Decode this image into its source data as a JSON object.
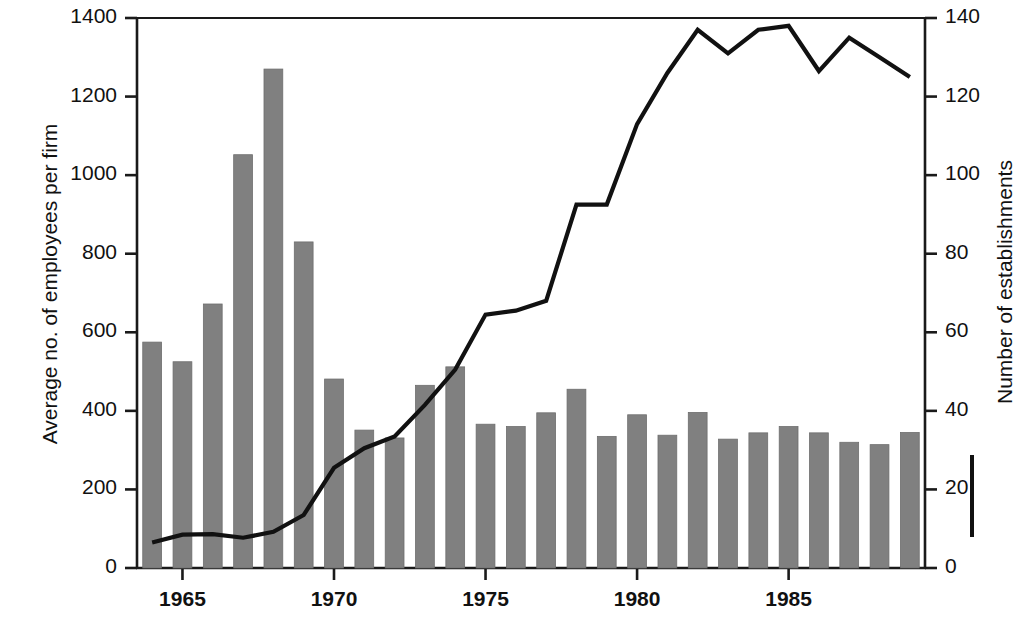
{
  "chart_data": {
    "type": "bar",
    "title": "",
    "xlabel": "",
    "ylabel": "Average no. of employees per firm",
    "ylabel_right": "Number of establishments",
    "grid": false,
    "legend_position": "right-axis",
    "ylim": [
      0,
      1400
    ],
    "ylim_right": [
      0,
      140
    ],
    "xlim": [
      1963.5,
      1989.5
    ],
    "ytick_labels": [
      "1400",
      "1200",
      "1000",
      "800",
      "600",
      "400",
      "200",
      "0"
    ],
    "ytick_values": [
      1400,
      1200,
      1000,
      800,
      600,
      400,
      200,
      0
    ],
    "ytick_right_labels": [
      "140",
      "120",
      "100",
      "80",
      "60",
      "40",
      "20",
      "0"
    ],
    "ytick_right_values": [
      140,
      120,
      100,
      80,
      60,
      40,
      20,
      0
    ],
    "xtick_labels": [
      "1965",
      "1970",
      "1975",
      "1980",
      "1985"
    ],
    "xtick_values": [
      1965,
      1970,
      1975,
      1980,
      1985
    ],
    "categories": [
      1964,
      1965,
      1966,
      1967,
      1968,
      1969,
      1970,
      1971,
      1972,
      1973,
      1974,
      1975,
      1976,
      1977,
      1978,
      1979,
      1980,
      1981,
      1982,
      1983,
      1984,
      1985,
      1986,
      1987,
      1988,
      1989
    ],
    "series": [
      {
        "name": "Average no. of employees per firm",
        "kind": "bar",
        "axis": "left",
        "color": "#808080",
        "values": [
          575,
          525,
          672,
          1052,
          1270,
          830,
          481,
          351,
          331,
          465,
          512,
          366,
          360,
          395,
          455,
          335,
          390,
          338,
          396,
          328,
          344,
          360,
          344,
          320,
          314,
          345
        ]
      },
      {
        "name": "Number of establishments",
        "kind": "line",
        "axis": "right",
        "color": "#111111",
        "values": [
          6.5,
          8.5,
          8.6,
          7.7,
          9.2,
          13.5,
          25.5,
          30.5,
          33.5,
          41.5,
          50.5,
          64.5,
          65.5,
          68,
          92.5,
          92.5,
          113,
          126,
          137,
          131,
          137,
          138,
          126.5,
          135,
          130,
          125
        ]
      }
    ]
  }
}
